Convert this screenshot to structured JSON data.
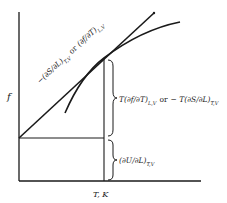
{
  "diagram": {
    "type": "thermodynamic force-temperature plot",
    "y_axis_label": "f",
    "x_axis_label": "T, K",
    "tangent_label": {
      "part1": "−(∂S/∂L)",
      "part1_sub": "T,V",
      "connector": "or",
      "part2": "(∂f/∂T)",
      "part2_sub": "L,V"
    },
    "upper_brace_label": {
      "part1": "T(∂f/∂T)",
      "part1_sub": "L,V",
      "connector": "or",
      "part2": "− T(∂S/∂L)",
      "part2_sub": "T,V"
    },
    "lower_brace_label": {
      "expr": "(∂U/∂L)",
      "sub": "T,V"
    },
    "colors": {
      "line": "#1a1a1a",
      "background": "#ffffff"
    }
  }
}
